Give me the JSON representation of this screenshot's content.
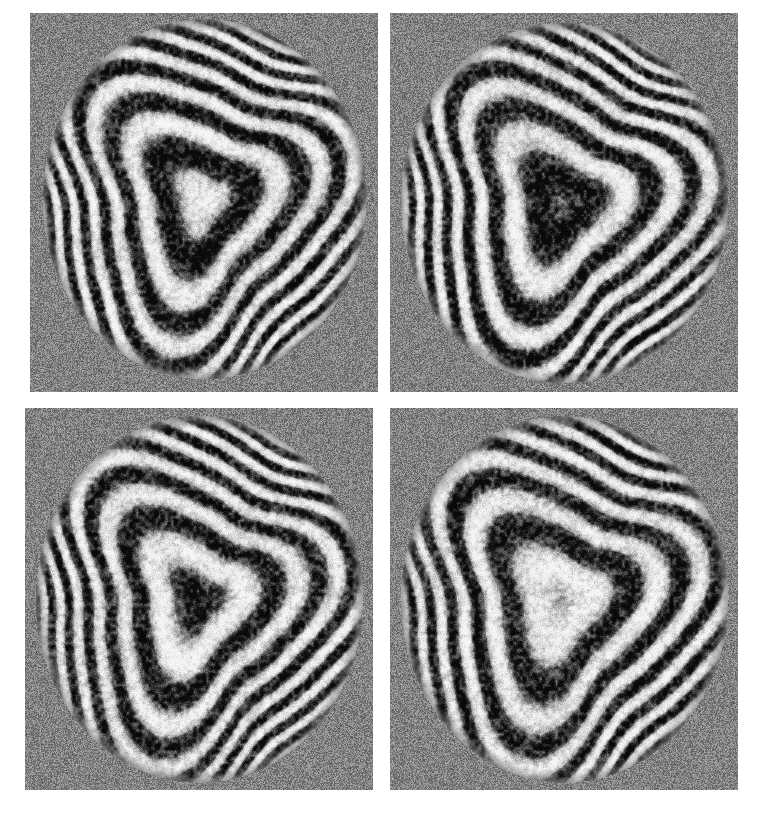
{
  "figure": {
    "canvas": {
      "width": 768,
      "height": 819
    },
    "background_color": "#ffffff",
    "panel_background_color": "#828282",
    "fringe_bright_color": "#ffffff",
    "fringe_dark_color": "#4a4a4a",
    "caption": ""
  },
  "panels": [
    {
      "id": "panel-top-left",
      "label": "a",
      "position": {
        "x": 30,
        "y": 13,
        "width": 348,
        "height": 379
      },
      "aperture": {
        "cx": 0.5,
        "cy": 0.49,
        "rx": 0.465,
        "ry": 0.475
      },
      "phase_deg": 0,
      "center_tone": "dark",
      "fringe_count": 4,
      "lobe_count": 3,
      "lobe_amplitude": 0.22,
      "lobe_rotation_deg": 14,
      "tilt_x": 0.16,
      "tilt_y": -0.05,
      "noise_strength": 0.34
    },
    {
      "id": "panel-top-right",
      "label": "b",
      "position": {
        "x": 390,
        "y": 13,
        "width": 348,
        "height": 379
      },
      "aperture": {
        "cx": 0.5,
        "cy": 0.5,
        "rx": 0.47,
        "ry": 0.475
      },
      "phase_deg": 90,
      "center_tone": "dark",
      "fringe_count": 4,
      "lobe_count": 3,
      "lobe_amplitude": 0.23,
      "lobe_rotation_deg": 8,
      "tilt_x": 0.2,
      "tilt_y": -0.04,
      "noise_strength": 0.34
    },
    {
      "id": "panel-bottom-left",
      "label": "c",
      "position": {
        "x": 25,
        "y": 408,
        "width": 348,
        "height": 382
      },
      "aperture": {
        "cx": 0.5,
        "cy": 0.5,
        "rx": 0.47,
        "ry": 0.48
      },
      "phase_deg": 180,
      "center_tone": "light",
      "fringe_count": 4,
      "lobe_count": 3,
      "lobe_amplitude": 0.23,
      "lobe_rotation_deg": 10,
      "tilt_x": 0.18,
      "tilt_y": -0.03,
      "noise_strength": 0.34
    },
    {
      "id": "panel-bottom-right",
      "label": "d",
      "position": {
        "x": 390,
        "y": 408,
        "width": 348,
        "height": 382
      },
      "aperture": {
        "cx": 0.5,
        "cy": 0.5,
        "rx": 0.47,
        "ry": 0.48
      },
      "phase_deg": 270,
      "center_tone": "bright",
      "fringe_count": 3.6,
      "lobe_count": 3,
      "lobe_amplitude": 0.23,
      "lobe_rotation_deg": 12,
      "tilt_x": 0.19,
      "tilt_y": -0.03,
      "noise_strength": 0.34
    }
  ],
  "chart_data": {
    "type": "heatmap",
    "xlabel": "",
    "ylabel": "",
    "legend": [],
    "grid": false,
    "series": [
      {
        "name": "a",
        "phase_deg": 0,
        "center_intensity": 0.25,
        "fringe_orders": [
          0,
          1,
          2,
          3,
          4
        ]
      },
      {
        "name": "b",
        "phase_deg": 90,
        "center_intensity": 0.22,
        "fringe_orders": [
          0,
          1,
          2,
          3,
          4
        ]
      },
      {
        "name": "c",
        "phase_deg": 180,
        "center_intensity": 0.7,
        "fringe_orders": [
          0,
          1,
          2,
          3,
          4
        ]
      },
      {
        "name": "d",
        "phase_deg": 270,
        "center_intensity": 0.97,
        "fringe_orders": [
          0,
          1,
          2,
          3
        ]
      }
    ]
  }
}
